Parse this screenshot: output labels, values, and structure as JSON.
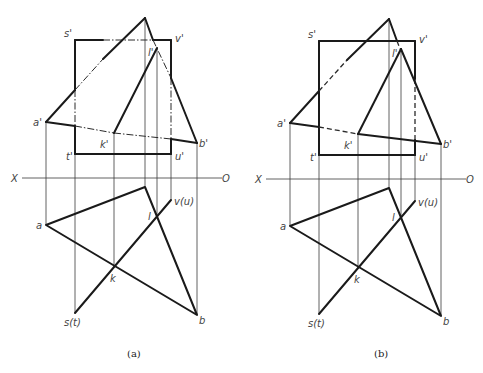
{
  "figure": {
    "panels": [
      {
        "id": "a",
        "caption": "(a)",
        "hidden_line_style": "dash-dot",
        "axis": {
          "left_label": "X",
          "right_label": "O"
        },
        "front_view_labels": {
          "s": "s'",
          "v": "v'",
          "t": "t'",
          "u": "u'",
          "a": "a'",
          "b": "b'",
          "k": "k'",
          "l": "l'"
        },
        "top_view_labels": {
          "a": "a",
          "b": "b",
          "k": "k",
          "l": "l",
          "st": "s(t)",
          "vu": "v(u)"
        }
      },
      {
        "id": "b",
        "caption": "(b)",
        "hidden_line_style": "dashed",
        "axis": {
          "left_label": "X",
          "right_label": "O"
        },
        "front_view_labels": {
          "s": "s'",
          "v": "v'",
          "t": "t'",
          "u": "u'",
          "a": "a'",
          "b": "b'",
          "k": "k'",
          "l": "l'"
        },
        "top_view_labels": {
          "a": "a",
          "b": "b",
          "k": "k",
          "l": "l",
          "st": "s(t)",
          "vu": "v(u)"
        }
      }
    ]
  },
  "colors": {
    "line": "#1a1a1a",
    "label": "#444444",
    "background": "#ffffff"
  }
}
